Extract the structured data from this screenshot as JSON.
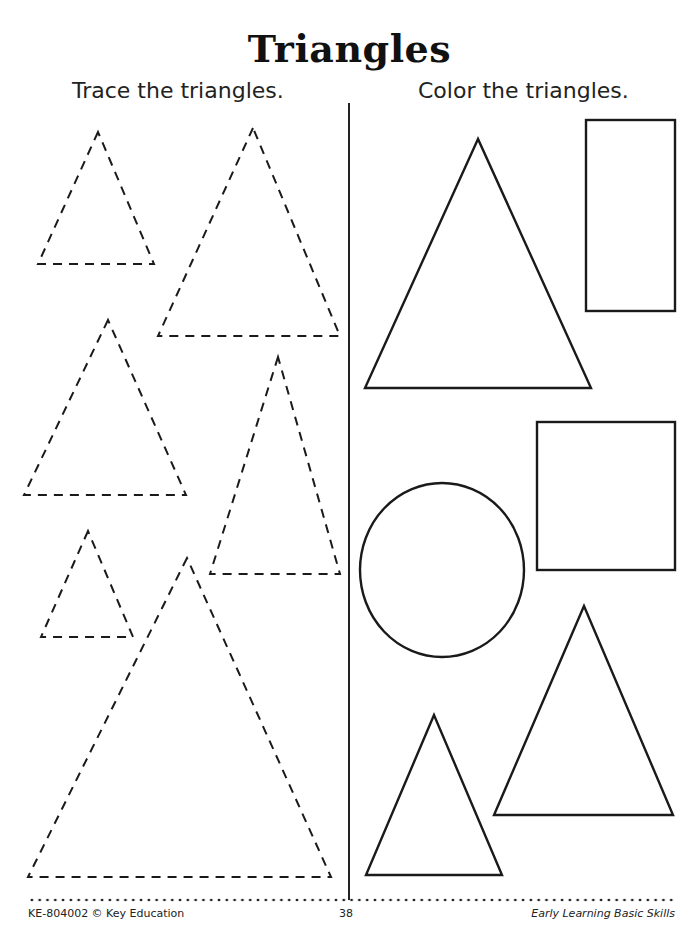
{
  "page": {
    "title": "Triangles",
    "left_section": {
      "instruction": "Trace the triangles.",
      "shapes": [
        {
          "type": "triangle",
          "style": "dashed",
          "points": [
            [
              98,
              132
            ],
            [
              38,
              264
            ],
            [
              154,
              264
            ]
          ]
        },
        {
          "type": "triangle",
          "style": "dashed",
          "points": [
            [
              253,
              128
            ],
            [
              158,
              336
            ],
            [
              340,
              336
            ]
          ]
        },
        {
          "type": "triangle",
          "style": "dashed",
          "points": [
            [
              108,
              320
            ],
            [
              24,
              495
            ],
            [
              186,
              495
            ]
          ]
        },
        {
          "type": "triangle",
          "style": "dashed",
          "points": [
            [
              278,
              357
            ],
            [
              210,
              574
            ],
            [
              340,
              574
            ]
          ]
        },
        {
          "type": "triangle",
          "style": "dashed",
          "points": [
            [
              88,
              531
            ],
            [
              41,
              637
            ],
            [
              133,
              637
            ]
          ]
        },
        {
          "type": "triangle",
          "style": "dashed",
          "points": [
            [
              187,
              558
            ],
            [
              28,
              877
            ],
            [
              331,
              877
            ]
          ]
        }
      ]
    },
    "right_section": {
      "instruction": "Color the triangles.",
      "shapes": [
        {
          "type": "triangle",
          "style": "solid",
          "points": [
            [
              478,
              139
            ],
            [
              365,
              388
            ],
            [
              591,
              388
            ]
          ]
        },
        {
          "type": "rectangle",
          "style": "solid",
          "x": 586,
          "y": 120,
          "width": 89,
          "height": 191
        },
        {
          "type": "square",
          "style": "solid",
          "x": 537,
          "y": 422,
          "width": 138,
          "height": 148
        },
        {
          "type": "circle",
          "style": "solid",
          "cx": 442,
          "cy": 570,
          "r": 82,
          "ry": 87
        },
        {
          "type": "triangle",
          "style": "solid",
          "points": [
            [
              584,
              606
            ],
            [
              494,
              815
            ],
            [
              673,
              815
            ]
          ]
        },
        {
          "type": "triangle",
          "style": "solid",
          "points": [
            [
              434,
              715
            ],
            [
              366,
              875
            ],
            [
              502,
              875
            ]
          ]
        }
      ]
    },
    "footer": {
      "left": "KE-804002 © Key Education",
      "page_number": "38",
      "right": "Early Learning Basic Skills"
    },
    "colors": {
      "ink": "#1a1a1a",
      "background": "#ffffff"
    }
  }
}
